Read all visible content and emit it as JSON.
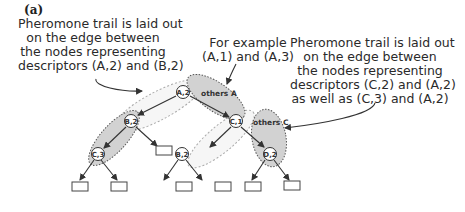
{
  "figure_label": "(a)",
  "annotations": {
    "left": {
      "lines": [
        "Pheromone trail is laid out",
        "on the edge between",
        "the nodes representing",
        "descriptors (A,2) and (B,2)"
      ]
    },
    "middle": {
      "lines": [
        "For example",
        "(A,1) and (A,3)"
      ]
    },
    "right": {
      "lines": [
        "Pheromone trail is laid out",
        "on the edge between",
        "the nodes representing",
        "descriptors (C,2) and (A,2)",
        "as well as (C,3) and (A,2)"
      ]
    }
  },
  "tree": {
    "nodes": [
      {
        "id": "A2",
        "label": "A,2"
      },
      {
        "id": "B2L",
        "label": "B,2"
      },
      {
        "id": "C3",
        "label": "C,3"
      },
      {
        "id": "C1",
        "label": "C,1"
      },
      {
        "id": "B2R",
        "label": "B,2"
      },
      {
        "id": "D2",
        "label": "D,2"
      }
    ],
    "groups": [
      {
        "id": "othersA",
        "label": "others A"
      },
      {
        "id": "othersC",
        "label": "others C"
      }
    ]
  },
  "colors": {
    "shade": "#d2d2d2",
    "line": "#333333",
    "dotted": "#999999"
  }
}
